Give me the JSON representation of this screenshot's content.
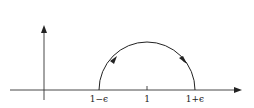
{
  "diagram": {
    "labels": {
      "left": "1−ϵ",
      "center": "1",
      "right": "1+ϵ"
    },
    "colors": {
      "stroke": "#222222",
      "background": "#ffffff"
    }
  }
}
